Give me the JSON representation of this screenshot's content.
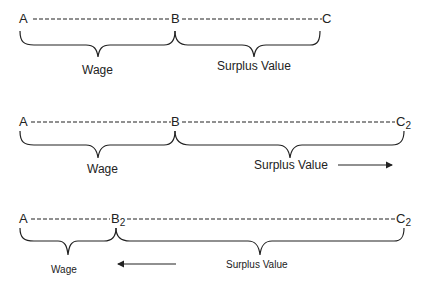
{
  "diagram": {
    "title": "",
    "rows": [
      {
        "points": [
          {
            "label": "A",
            "sub": ""
          },
          {
            "label": "B",
            "sub": ""
          },
          {
            "label": "C",
            "sub": ""
          }
        ],
        "segments": [
          {
            "label": "Wage"
          },
          {
            "label": "Surplus Value"
          }
        ],
        "arrow": null
      },
      {
        "points": [
          {
            "label": "A",
            "sub": ""
          },
          {
            "label": "B",
            "sub": ""
          },
          {
            "label": "C",
            "sub": "2"
          }
        ],
        "segments": [
          {
            "label": "Wage"
          },
          {
            "label": "Surplus Value"
          }
        ],
        "arrow": {
          "direction": "right",
          "icon": "arrow-right-icon"
        }
      },
      {
        "points": [
          {
            "label": "A",
            "sub": ""
          },
          {
            "label": "B",
            "sub": "2"
          },
          {
            "label": "C",
            "sub": "2"
          }
        ],
        "segments": [
          {
            "label": "Wage"
          },
          {
            "label": "Surplus Value"
          }
        ],
        "arrow": {
          "direction": "left",
          "icon": "arrow-left-icon"
        }
      }
    ]
  }
}
